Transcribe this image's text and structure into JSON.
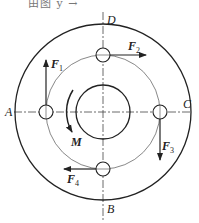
{
  "top_text": "由图 y →",
  "diagram": {
    "center": [
      103,
      112
    ],
    "outer_radius": 88,
    "bolt_circle_radius": 57,
    "inner_radius": 27,
    "hole_radius": 7,
    "axis_labels": {
      "top": "D",
      "bottom": "B",
      "left": "A",
      "right": "C"
    },
    "forces": [
      {
        "name": "F",
        "sub": "1",
        "at": "A",
        "direction": "up"
      },
      {
        "name": "F",
        "sub": "2",
        "at": "D",
        "direction": "right"
      },
      {
        "name": "F",
        "sub": "3",
        "at": "C",
        "direction": "down"
      },
      {
        "name": "F",
        "sub": "4",
        "at": "B",
        "direction": "left"
      }
    ],
    "moment": {
      "label": "M",
      "direction": "counterclockwise-down"
    }
  }
}
